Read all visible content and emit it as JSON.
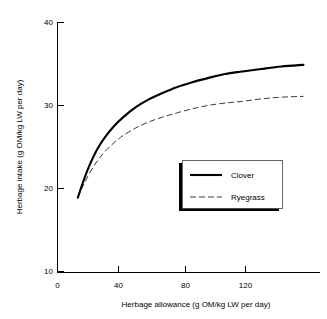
{
  "chart_data": {
    "type": "line",
    "title": "",
    "xlabel": "Herbage allowance (g OM/kg LW per day)",
    "ylabel": "Herbage intake (g OM/kg LW per day)",
    "xlim": [
      0,
      172
    ],
    "ylim": [
      10,
      40
    ],
    "xticks": [
      0,
      40,
      80,
      120
    ],
    "yticks": [
      10,
      20,
      30,
      40
    ],
    "xtick_labels": [
      "0",
      "40",
      "80",
      "120"
    ],
    "ytick_labels": [
      "10",
      "20",
      "30",
      "40"
    ],
    "grid": false,
    "legend_position": "center-right",
    "series": [
      {
        "name": "Clover",
        "style": "solid",
        "color": "#000000",
        "x": [
          13,
          16,
          20,
          25,
          30,
          36,
          42,
          50,
          58,
          67,
          76,
          86,
          96,
          107,
          118,
          130,
          143,
          157
        ],
        "y": [
          18.9,
          20.6,
          22.6,
          24.6,
          26.1,
          27.5,
          28.6,
          29.8,
          30.7,
          31.5,
          32.2,
          32.8,
          33.3,
          33.8,
          34.1,
          34.4,
          34.7,
          34.9
        ]
      },
      {
        "name": "Ryegrass",
        "style": "dashed",
        "color": "#3a3a3a",
        "x": [
          13,
          16,
          20,
          25,
          30,
          36,
          42,
          50,
          58,
          67,
          76,
          86,
          96,
          107,
          118,
          130,
          143,
          157
        ],
        "y": [
          18.9,
          20.2,
          21.7,
          23.2,
          24.4,
          25.5,
          26.4,
          27.3,
          28.0,
          28.6,
          29.1,
          29.6,
          30.0,
          30.3,
          30.5,
          30.8,
          31.0,
          31.1
        ]
      }
    ]
  },
  "legend": {
    "entries": [
      {
        "label": "Clover"
      },
      {
        "label": "Ryegrass"
      }
    ]
  },
  "axes": {
    "x_title": "Herbage allowance (g OM/kg LW per day)",
    "y_title": "Herbage intake (g OM/kg LW per day)"
  }
}
